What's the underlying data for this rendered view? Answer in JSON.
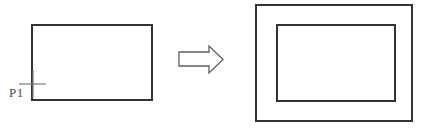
{
  "labels": {
    "pick_point": "P1"
  },
  "colors": {
    "background": "#ffffff",
    "shape_line": "#333333",
    "marker_line": "#7a7a7a",
    "arrow_line": "#5f5f5f",
    "label_text": "#4a4a4a"
  }
}
